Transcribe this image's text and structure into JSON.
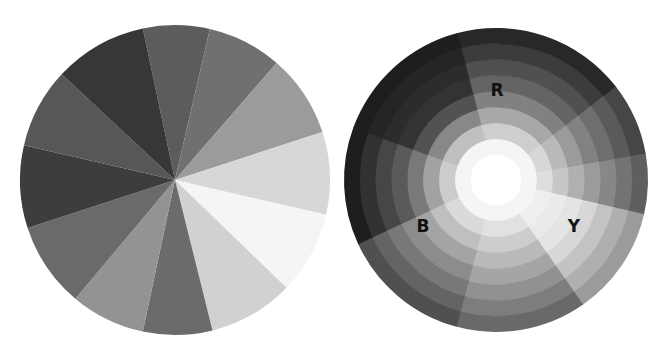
{
  "left_wheel": {
    "name": "hue-wheel",
    "center": [
      175,
      180
    ],
    "radius": 155,
    "segments": [
      {
        "start": -12,
        "end": 13,
        "color": "#5c5c5c"
      },
      {
        "start": 13,
        "end": 41,
        "color": "#707070"
      },
      {
        "start": 41,
        "end": 72,
        "color": "#9b9b9b"
      },
      {
        "start": 72,
        "end": 103,
        "color": "#d7d7d7"
      },
      {
        "start": 103,
        "end": 134,
        "color": "#f5f5f5"
      },
      {
        "start": 134,
        "end": 166,
        "color": "#d1d1d1"
      },
      {
        "start": 166,
        "end": 192,
        "color": "#6b6b6b"
      },
      {
        "start": 192,
        "end": 220,
        "color": "#939393"
      },
      {
        "start": 220,
        "end": 252,
        "color": "#6a6a6a"
      },
      {
        "start": 252,
        "end": 283,
        "color": "#3d3d3d"
      },
      {
        "start": 283,
        "end": 313,
        "color": "#575757"
      },
      {
        "start": 313,
        "end": 348,
        "color": "#373737"
      }
    ]
  },
  "right_wheel": {
    "name": "tonal-wheel",
    "center": [
      496,
      180
    ],
    "radius": 152,
    "inner_white_radius": 25,
    "ring_count": 8,
    "wedges": [
      {
        "start": -15,
        "end": 52,
        "base": 110,
        "label": "R"
      },
      {
        "start": 52,
        "end": 80,
        "base": 140,
        "label": ""
      },
      {
        "start": 80,
        "end": 103,
        "base": 165,
        "label": ""
      },
      {
        "start": 103,
        "end": 145,
        "base": 225,
        "label": "Y"
      },
      {
        "start": 145,
        "end": 195,
        "base": 175,
        "label": ""
      },
      {
        "start": 195,
        "end": 245,
        "base": 150,
        "label": ""
      },
      {
        "start": 245,
        "end": 290,
        "base": 100,
        "label": "B"
      },
      {
        "start": 290,
        "end": 345,
        "base": 55,
        "label": ""
      }
    ],
    "labels": [
      {
        "text": "R",
        "x": 497,
        "y": 96
      },
      {
        "text": "B",
        "x": 423,
        "y": 232
      },
      {
        "text": "Y",
        "x": 574,
        "y": 232
      }
    ]
  }
}
